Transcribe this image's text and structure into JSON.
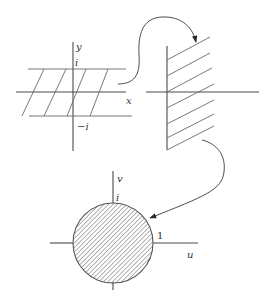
{
  "figure": {
    "panel_strip": {
      "axis_x_label": "x",
      "axis_y_label": "y",
      "upper_bound_label": "i",
      "lower_bound_label": "−i"
    },
    "panel_half_plane": {
      "region": "right half-plane (hatched)"
    },
    "panel_disk": {
      "axis_u_label": "u",
      "axis_v_label": "v",
      "top_label": "i",
      "right_label": "1"
    },
    "arrows": [
      {
        "from": "strip",
        "to": "half-plane"
      },
      {
        "from": "half-plane",
        "to": "disk"
      }
    ],
    "colors": {
      "line": "#4a4a4a",
      "hatch": "#6a6a6a",
      "background": "#ffffff"
    }
  }
}
